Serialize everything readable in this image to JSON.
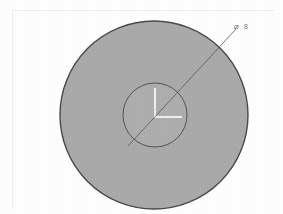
{
  "document": {
    "kind": "technical-drawing",
    "background_color": "#ffffff",
    "border": {
      "visible": true,
      "color": "#ececec",
      "left_x": 12,
      "top_y": 10,
      "right_x": 275,
      "bottom_y": 208
    }
  },
  "drawing": {
    "title": "circular part section view",
    "fill_color": "#aaaaaa",
    "outline_color": "#4a4a4a",
    "centerline_color": "#ffffff",
    "leader_color": "#585858",
    "outer_circle": {
      "name": "outer-circle",
      "center_x": 154,
      "center_y": 115,
      "radius": 94,
      "stroke_width": 1.4
    },
    "inner_circle": {
      "name": "inner-circle",
      "center_x": 155,
      "center_y": 115,
      "radius": 32,
      "stroke_width": 0.9
    },
    "centerlines": [
      {
        "name": "vertical-centerline",
        "x1": 155,
        "y1": 88,
        "x2": 155,
        "y2": 117,
        "width": 1.6
      },
      {
        "name": "horizontal-centerline",
        "x1": 154,
        "y1": 117,
        "x2": 182,
        "y2": 117,
        "width": 1.6
      }
    ],
    "leader_line": {
      "name": "leader-line",
      "x1": 128,
      "y1": 146,
      "x2": 236,
      "y2": 29,
      "stroke_width": 0.8
    }
  },
  "annotations": {
    "diameter_callout": {
      "symbol": "⌀",
      "symbol_name": "diameter-symbol",
      "value": "8",
      "full_text": "⌀ 8",
      "x": 232,
      "y": 28
    }
  }
}
